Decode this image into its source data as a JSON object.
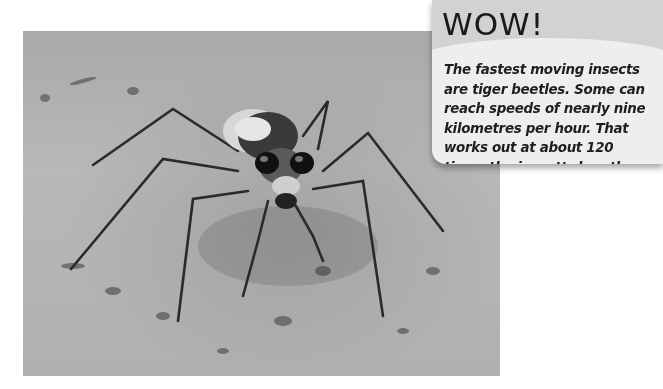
{
  "photo": {
    "subject": "tiger beetle on sand",
    "alt": "Close-up photograph of a tiger beetle standing on sandy ground"
  },
  "fact_box": {
    "title": "WOW!",
    "body": "The fastest moving insects are tiger beetles. Some can reach speeds of nearly nine kilometres per hour. That works out at about 120 times the insect’s length every second."
  },
  "colors": {
    "card_header": "#d2d2d2",
    "card_body": "#eeeeee",
    "text": "#1e1e1e"
  }
}
